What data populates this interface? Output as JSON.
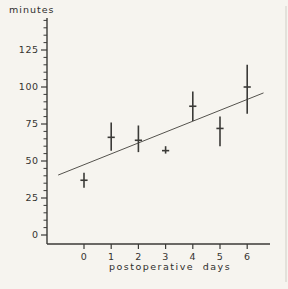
{
  "figure": {
    "background_color": "#f6f4ef",
    "line_color": "#3b3a37",
    "trend_line_color": "#55534e",
    "text_color": "#35332f"
  },
  "chart_data": {
    "type": "scatter",
    "title": "",
    "xlabel": "postoperative days",
    "ylabel": "minutes",
    "marker": "plus-with-vertical-error-bar",
    "grid": false,
    "legend": "none",
    "xlim": [
      -1.35,
      7.2
    ],
    "ylim": [
      -6,
      145
    ],
    "x_ticks": [
      0,
      1,
      2,
      3,
      4,
      5,
      6
    ],
    "y_ticks_major": [
      0,
      25,
      50,
      75,
      100,
      125
    ],
    "y_minor_step": 5,
    "y_axis_top_value": 145,
    "points": [
      {
        "day": 0,
        "mean": 37,
        "low": 32,
        "high": 42
      },
      {
        "day": 1,
        "mean": 66,
        "low": 57,
        "high": 76
      },
      {
        "day": 2,
        "mean": 64,
        "low": 56,
        "high": 74
      },
      {
        "day": 3,
        "mean": 57,
        "low": 55,
        "high": 60
      },
      {
        "day": 4,
        "mean": 87,
        "low": 77,
        "high": 97
      },
      {
        "day": 5,
        "mean": 72,
        "low": 60,
        "high": 80
      },
      {
        "day": 6,
        "mean": 100,
        "low": 82,
        "high": 115
      }
    ],
    "trend_line": {
      "x_start": -0.95,
      "y_start": 40.5,
      "x_end": 6.6,
      "y_end": 96
    }
  }
}
